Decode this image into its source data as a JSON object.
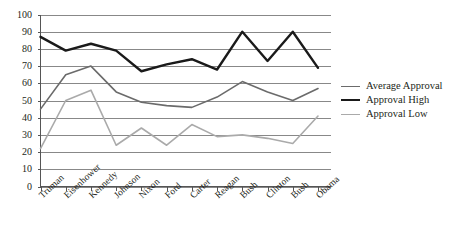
{
  "chart_data": {
    "type": "line",
    "title": "",
    "xlabel": "",
    "ylabel": "",
    "ylim": [
      0,
      100
    ],
    "ytick_step": 10,
    "grid": true,
    "legend_position": "right",
    "categories": [
      "Truman",
      "Eisenhower",
      "Kennedy",
      "Johnson",
      "Nixon",
      "Ford",
      "Carter",
      "Reagan",
      "Bush",
      "Clinton",
      "Bush",
      "Obama"
    ],
    "ytick_labels": [
      "100",
      "90",
      "80",
      "70",
      "60",
      "50",
      "40",
      "30",
      "20",
      "10",
      "0"
    ],
    "series": [
      {
        "name": "Average Approval",
        "color": "#6b6b6b",
        "width": 1.6,
        "values": [
          45,
          65,
          70,
          55,
          49,
          47,
          46,
          52,
          61,
          55,
          50,
          57
        ]
      },
      {
        "name": "Approval High",
        "color": "#1a1a1a",
        "width": 2.4,
        "values": [
          87,
          79,
          83,
          79,
          67,
          71,
          74,
          68,
          90,
          73,
          90,
          69
        ]
      },
      {
        "name": "Approval Low",
        "color": "#aaaaaa",
        "width": 1.6,
        "values": [
          22,
          50,
          56,
          24,
          34,
          24,
          36,
          29,
          30,
          28,
          25,
          41
        ]
      }
    ]
  },
  "legend": {
    "items": [
      {
        "label": "Average Approval"
      },
      {
        "label": "Approval High"
      },
      {
        "label": "Approval Low"
      }
    ]
  },
  "axes": {
    "gridline_color": "#888888",
    "axis_color": "#555555"
  }
}
